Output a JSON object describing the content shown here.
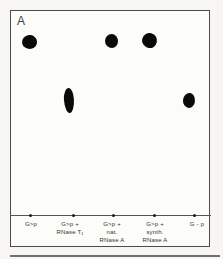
{
  "figure": {
    "panel_label": "A",
    "figure_type": "thin-layer chromatogram plate with sample spots",
    "colors": {
      "page_background": "#f7f6f2",
      "plate_background": "#fcfcf8",
      "plate_border": "#4c4c4c",
      "spot": "#0a0a0a",
      "label_text": "#333330",
      "origin_line": "#565656",
      "bottom_rule": "#6f6f6c"
    },
    "lanes": [
      {
        "id": 1,
        "lines": [
          "G>p"
        ],
        "center_x": 31,
        "origin_x": 30
      },
      {
        "id": 2,
        "lines": [
          "G>p +",
          "RNase T₁"
        ],
        "center_x": 70,
        "origin_x": 73
      },
      {
        "id": 3,
        "lines": [
          "G>p +",
          "nat.",
          "RNase A"
        ],
        "center_x": 112,
        "origin_x": 113
      },
      {
        "id": 4,
        "lines": [
          "G>p +",
          "synth.",
          "RNase A"
        ],
        "center_x": 155,
        "origin_x": 154
      },
      {
        "id": 5,
        "lines": [
          "G - p"
        ],
        "center_x": 197,
        "origin_x": 194
      }
    ],
    "spots": [
      {
        "lane": 1,
        "cx": 29,
        "cy": 42,
        "w": 15,
        "h": 14,
        "shape": "round",
        "rot": -8
      },
      {
        "lane": 3,
        "cx": 111,
        "cy": 41,
        "w": 13,
        "h": 14,
        "shape": "round",
        "rot": 0
      },
      {
        "lane": 4,
        "cx": 149,
        "cy": 40,
        "w": 15,
        "h": 15,
        "shape": "round",
        "rot": 12
      },
      {
        "lane": 2,
        "cx": 69,
        "cy": 100,
        "w": 10,
        "h": 25,
        "shape": "elongated",
        "rot": -4
      },
      {
        "lane": 5,
        "cx": 189,
        "cy": 100,
        "w": 12,
        "h": 15,
        "shape": "round",
        "rot": 6
      }
    ]
  }
}
